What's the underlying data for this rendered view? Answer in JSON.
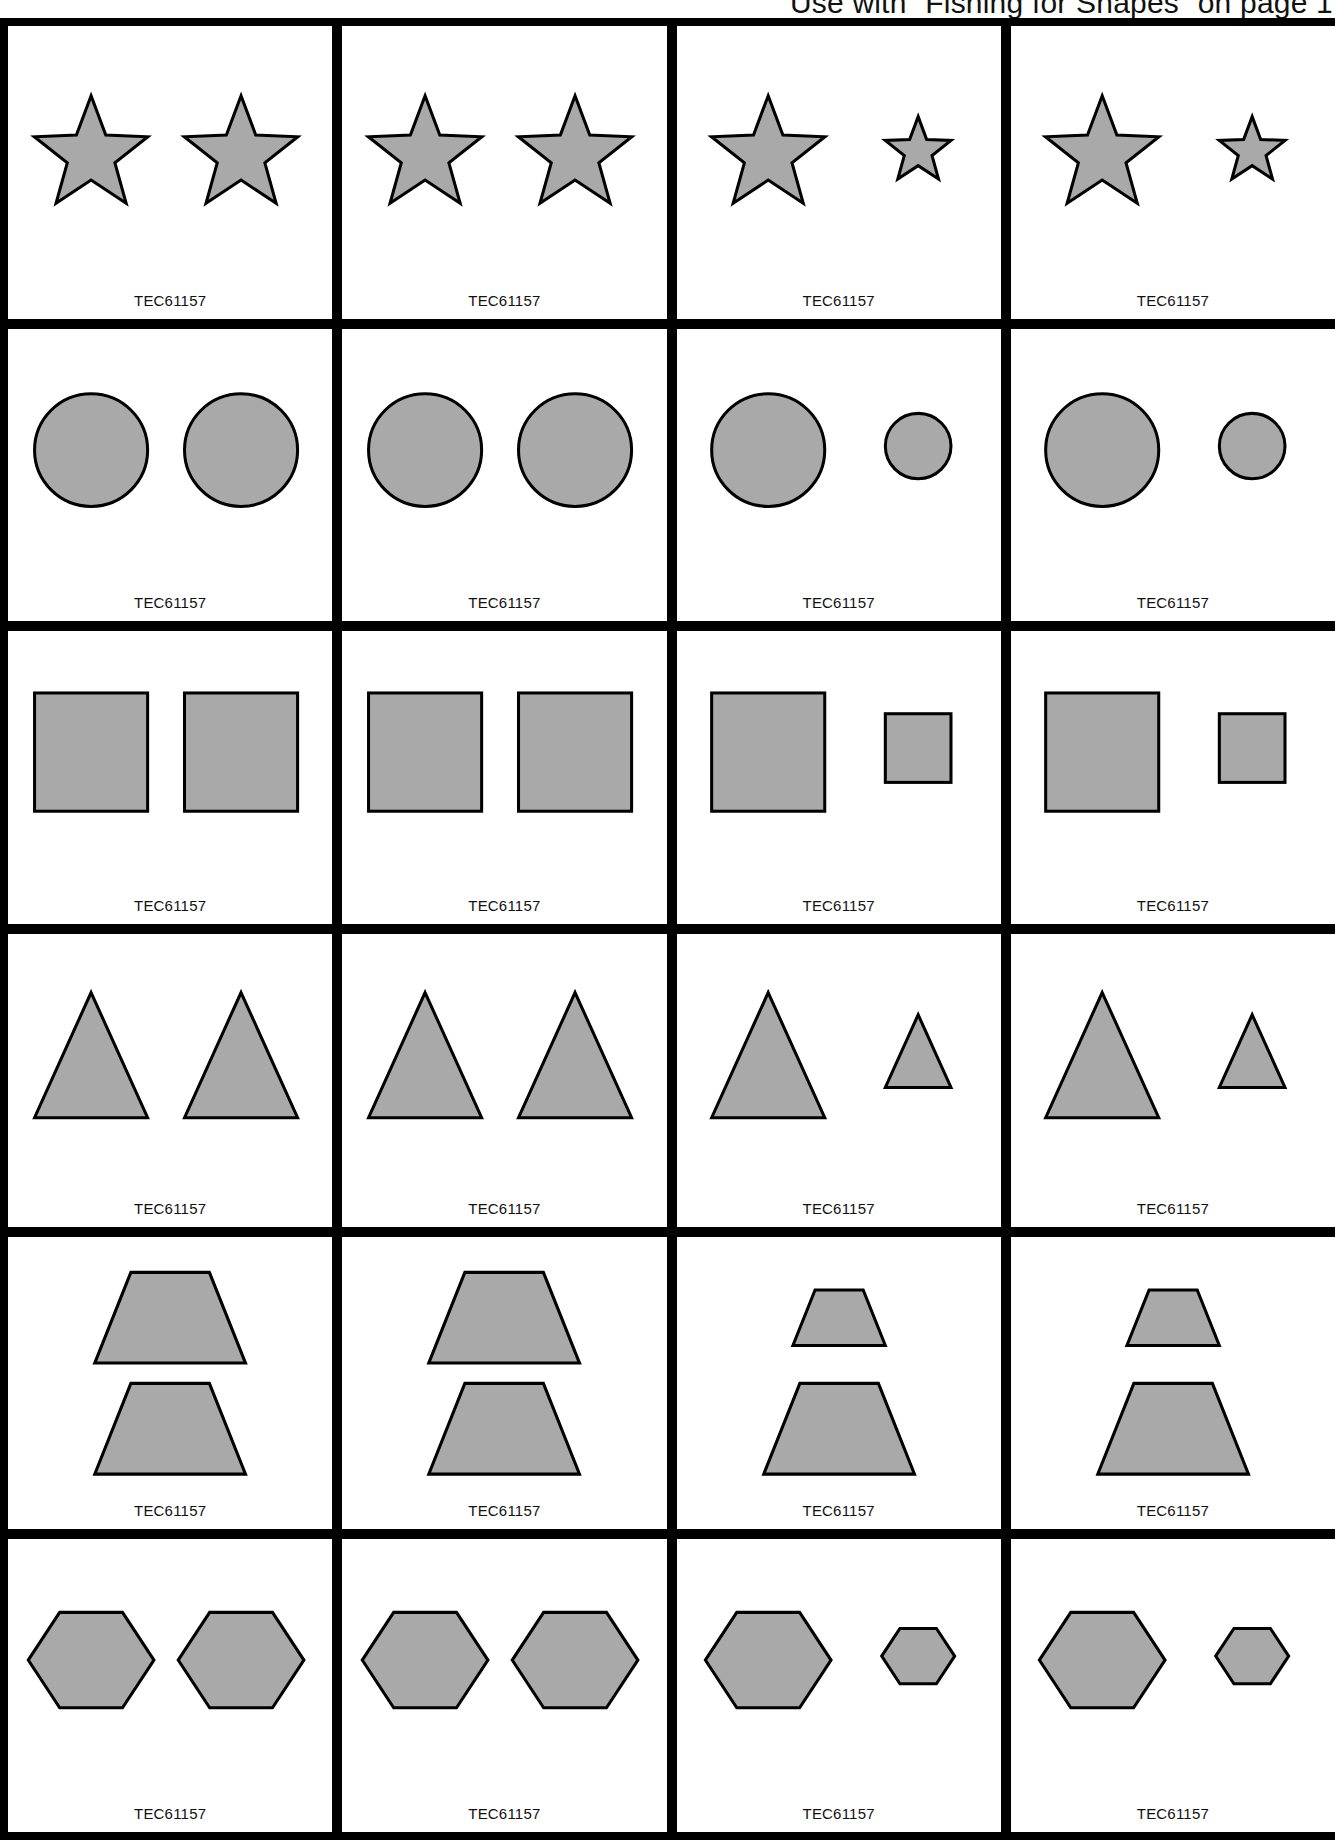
{
  "header": {
    "text": "Use with “Fishing for Shapes” on page 1"
  },
  "style": {
    "shape_fill": "#a9a9a9",
    "shape_stroke": "#000000",
    "grid_line": "#000000"
  },
  "rows": [
    {
      "shape": "star",
      "cards": [
        {
          "code": "TEC61157",
          "pair": "same",
          "sizes": [
            "large",
            "large"
          ]
        },
        {
          "code": "TEC61157",
          "pair": "same",
          "sizes": [
            "large",
            "large"
          ]
        },
        {
          "code": "TEC61157",
          "pair": "diff",
          "sizes": [
            "large",
            "small"
          ]
        },
        {
          "code": "TEC61157",
          "pair": "diff",
          "sizes": [
            "large",
            "small"
          ]
        }
      ]
    },
    {
      "shape": "circle",
      "cards": [
        {
          "code": "TEC61157",
          "pair": "same",
          "sizes": [
            "large",
            "large"
          ]
        },
        {
          "code": "TEC61157",
          "pair": "same",
          "sizes": [
            "large",
            "large"
          ]
        },
        {
          "code": "TEC61157",
          "pair": "diff",
          "sizes": [
            "large",
            "small"
          ]
        },
        {
          "code": "TEC61157",
          "pair": "diff",
          "sizes": [
            "large",
            "small"
          ]
        }
      ]
    },
    {
      "shape": "square",
      "cards": [
        {
          "code": "TEC61157",
          "pair": "same",
          "sizes": [
            "large",
            "large"
          ]
        },
        {
          "code": "TEC61157",
          "pair": "same",
          "sizes": [
            "large",
            "large"
          ]
        },
        {
          "code": "TEC61157",
          "pair": "diff",
          "sizes": [
            "large",
            "small"
          ]
        },
        {
          "code": "TEC61157",
          "pair": "diff",
          "sizes": [
            "large",
            "small"
          ]
        }
      ]
    },
    {
      "shape": "triangle",
      "cards": [
        {
          "code": "TEC61157",
          "pair": "same",
          "sizes": [
            "large",
            "large"
          ]
        },
        {
          "code": "TEC61157",
          "pair": "same",
          "sizes": [
            "large",
            "large"
          ]
        },
        {
          "code": "TEC61157",
          "pair": "diff",
          "sizes": [
            "large",
            "small"
          ]
        },
        {
          "code": "TEC61157",
          "pair": "diff",
          "sizes": [
            "large",
            "small"
          ]
        }
      ]
    },
    {
      "shape": "trapezoid",
      "cards": [
        {
          "code": "TEC61157",
          "pair": "same",
          "sizes": [
            "large",
            "large"
          ]
        },
        {
          "code": "TEC61157",
          "pair": "same",
          "sizes": [
            "large",
            "large"
          ]
        },
        {
          "code": "TEC61157",
          "pair": "diff",
          "sizes": [
            "small",
            "large"
          ]
        },
        {
          "code": "TEC61157",
          "pair": "diff",
          "sizes": [
            "small",
            "large"
          ]
        }
      ]
    },
    {
      "shape": "hexagon",
      "cards": [
        {
          "code": "TEC61157",
          "pair": "same",
          "sizes": [
            "large",
            "large"
          ]
        },
        {
          "code": "TEC61157",
          "pair": "same",
          "sizes": [
            "large",
            "large"
          ]
        },
        {
          "code": "TEC61157",
          "pair": "diff",
          "sizes": [
            "large",
            "small"
          ]
        },
        {
          "code": "TEC61157",
          "pair": "diff",
          "sizes": [
            "large",
            "small"
          ]
        }
      ]
    }
  ]
}
